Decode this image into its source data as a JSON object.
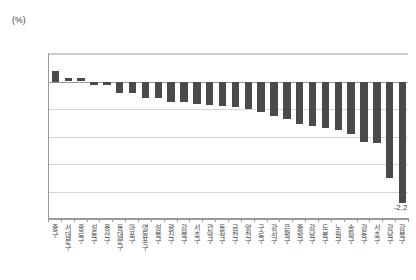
{
  "unit_label": "(%)",
  "colors": {
    "bar": "#4a4a4a",
    "gridline": "#d5d5d5",
    "axis": "#9a9a9a",
    "text": "#4a4a4a"
  },
  "chart_data": {
    "type": "bar",
    "title": "",
    "subtitle": "",
    "xlabel": "",
    "ylabel": "(%)",
    "unit": "%",
    "decimal_separator": ",",
    "grid": true,
    "legend": false,
    "orientation": "vertical",
    "ylim": [
      -2.5,
      0.5
    ],
    "ytick_labels": [
      "0,5",
      "0",
      "-0,5",
      "-1",
      "-1,5",
      "-2",
      "-2,5"
    ],
    "yticks": [
      0.5,
      0,
      -0.5,
      -1,
      -1.5,
      -2,
      -2.5
    ],
    "categories": [
      "중구",
      "서대문구",
      "종로구",
      "성동구",
      "용산구",
      "동대문구",
      "마포구",
      "영등포구",
      "성북구",
      "광진구",
      "강북구",
      "서초구",
      "관악구",
      "동작구",
      "금천구",
      "양천구",
      "구로구",
      "강서구",
      "은평구",
      "중랑구",
      "강남구",
      "도봉구",
      "노원구",
      "송파구",
      "강동구",
      "서초구",
      "강남구",
      "강북구"
    ],
    "values": [
      0.2,
      0.07,
      0.07,
      -0.07,
      -0.07,
      -0.2,
      -0.2,
      -0.3,
      -0.3,
      -0.38,
      -0.38,
      -0.4,
      -0.42,
      -0.45,
      -0.47,
      -0.5,
      -0.55,
      -0.62,
      -0.68,
      -0.78,
      -0.8,
      -0.85,
      -0.88,
      -0.95,
      -1.1,
      -1.12,
      -1.75,
      -2.2
    ],
    "annotations": [
      {
        "label": "-2,2",
        "category_index": 27,
        "value": -2.2
      }
    ]
  }
}
